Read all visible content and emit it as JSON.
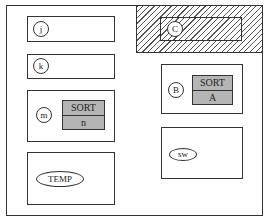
{
  "diagram": {
    "type": "block-layout",
    "frame": {
      "label": ""
    },
    "hatched_region": {
      "pattern": "diagonal-hatch",
      "node": {
        "label": "C",
        "shape": "circle"
      }
    },
    "left_column": [
      {
        "id": "box-j",
        "node": {
          "label": "j",
          "shape": "circle"
        }
      },
      {
        "id": "box-k",
        "node": {
          "label": "k",
          "shape": "circle"
        }
      },
      {
        "id": "box-m",
        "node": {
          "label": "m",
          "shape": "circle"
        },
        "table": {
          "header": "SORT",
          "value": "n"
        }
      },
      {
        "id": "box-temp",
        "node": {
          "label": "TEMP",
          "shape": "ellipse"
        }
      }
    ],
    "right_column": [
      {
        "id": "box-b",
        "node": {
          "label": "B",
          "shape": "circle"
        },
        "table": {
          "header": "SORT",
          "value": "A"
        }
      },
      {
        "id": "box-sw",
        "node": {
          "label": "sw",
          "shape": "ellipse"
        }
      }
    ],
    "colors": {
      "line": "#333333",
      "table_fill": "#b5b5b5",
      "background": "#ffffff"
    }
  }
}
